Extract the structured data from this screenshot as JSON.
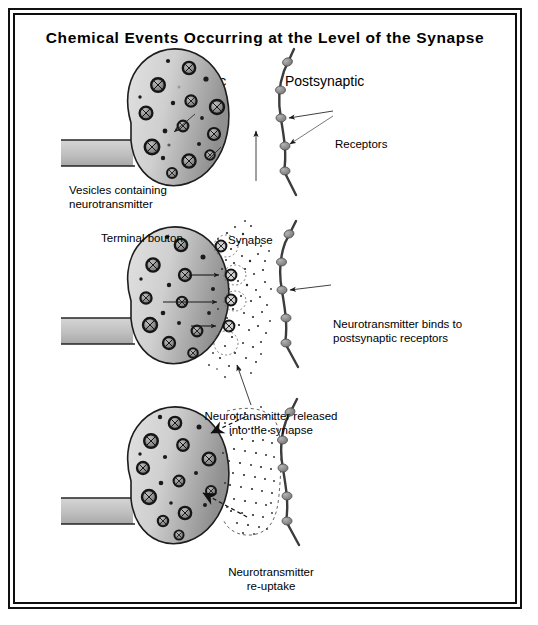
{
  "figure": {
    "title": "Chemical Events Occurring at the Level of the Synapse",
    "column_headings": {
      "presynaptic": "Presynaptic",
      "postsynaptic": "Postsynaptic"
    }
  },
  "panels": [
    {
      "id": "panel-resting",
      "stage_number": 1,
      "stage_name": "resting-terminal",
      "labels": {
        "vesicles": "Vesicles containing\nneurotransmitter",
        "terminal_bouton": "Terminal bouton",
        "synapse": "Synapse",
        "receptors": "Receptors"
      },
      "vesicle_count": 17,
      "receptor_count": 5
    },
    {
      "id": "panel-release",
      "stage_number": 2,
      "stage_name": "neurotransmitter-release",
      "labels": {
        "released": "Neurotransmitter released\ninto the synapse",
        "binds": "Neurotransmitter binds to\npostsynaptic receptors"
      },
      "vesicle_count": 16,
      "receptor_count": 5,
      "fusing_vesicle_count": 4
    },
    {
      "id": "panel-reuptake",
      "stage_number": 3,
      "stage_name": "neurotransmitter-reuptake",
      "labels": {
        "reuptake": "Neurotransmitter\nre-uptake"
      },
      "vesicle_count": 16,
      "receptor_count": 5,
      "reuptake_arrow_count": 2
    }
  ],
  "colors": {
    "ink": "#111111",
    "bouton_fill_light": "#d9d9d9",
    "bouton_fill_dark": "#9a9a9a",
    "axon_fill": "#c2c2c2",
    "vesicle_ring": "#1a1a1a",
    "vesicle_fill": "#8c8c8c",
    "membrane_line": "#3a3a3a",
    "receptor_fill": "#8f8f8f",
    "transmitter_dot": "#2b2b2b",
    "frame": "#111111",
    "background": "#ffffff"
  }
}
